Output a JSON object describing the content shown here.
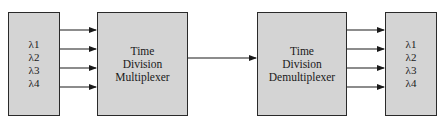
{
  "diagram": {
    "nodes": [
      {
        "id": "input",
        "lines": [
          "λ1",
          "λ2",
          "λ3",
          "λ4"
        ]
      },
      {
        "id": "mux",
        "lines": [
          "Time",
          "Division",
          "Multiplexer"
        ]
      },
      {
        "id": "demux",
        "lines": [
          "Time",
          "Division",
          "Demultiplexer"
        ]
      },
      {
        "id": "output",
        "lines": [
          "λ1",
          "λ2",
          "λ3",
          "λ4"
        ]
      }
    ],
    "edges": [
      {
        "from": "input",
        "to": "mux",
        "label": "λ1"
      },
      {
        "from": "input",
        "to": "mux",
        "label": "λ2"
      },
      {
        "from": "input",
        "to": "mux",
        "label": "λ3"
      },
      {
        "from": "input",
        "to": "mux",
        "label": "λ4"
      },
      {
        "from": "mux",
        "to": "demux",
        "label": ""
      },
      {
        "from": "demux",
        "to": "output",
        "label": "λ1"
      },
      {
        "from": "demux",
        "to": "output",
        "label": "λ2"
      },
      {
        "from": "demux",
        "to": "output",
        "label": "λ3"
      },
      {
        "from": "demux",
        "to": "output",
        "label": "λ4"
      }
    ],
    "colors": {
      "box_fill": "#d4d4d4",
      "stroke": "#2a2a2a",
      "background": "#ffffff"
    }
  }
}
